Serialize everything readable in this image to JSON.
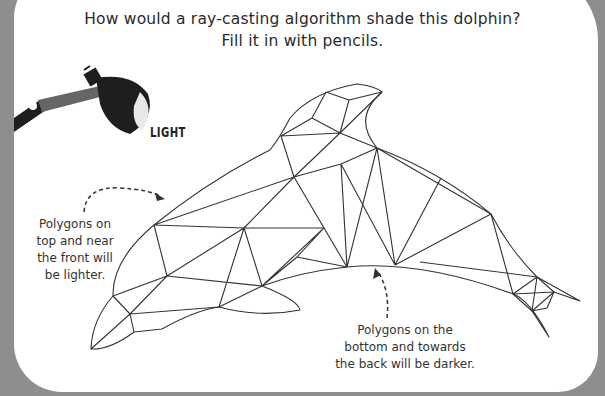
{
  "title": {
    "line1": "How would a ray-casting algorithm shade this dolphin?",
    "line2": "Fill it in with pencils."
  },
  "lamp": {
    "label": "LIGHT",
    "icon": "desk-lamp-icon"
  },
  "annotations": {
    "light": {
      "lines": [
        "Polygons on",
        "top and near",
        "the front will",
        "be lighter."
      ]
    },
    "dark": {
      "lines": [
        "Polygons on the",
        "bottom and towards",
        "the back will be darker."
      ]
    }
  },
  "colors": {
    "background": "#8e8e8e",
    "panel": "#ffffff",
    "ink": "#2a2a2a",
    "lamp": "#1e1e1e",
    "lamp_arm": "#555555"
  }
}
